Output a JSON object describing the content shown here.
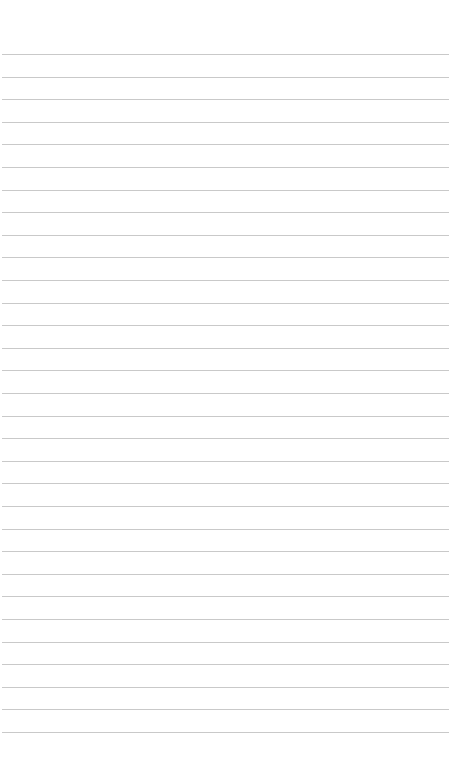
{
  "page": {
    "type": "lined-paper",
    "background_color": "#ffffff",
    "line_color": "#c9c9c9",
    "line_count": 31,
    "first_line_y": 54,
    "line_spacing": 22.6
  }
}
